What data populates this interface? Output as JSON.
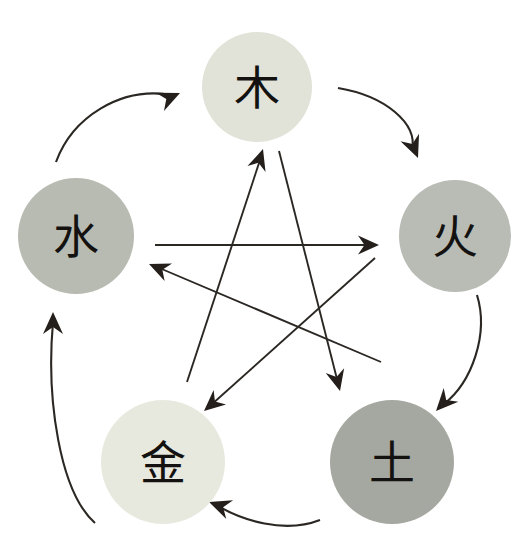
{
  "diagram": {
    "background_color": "#ffffff",
    "line_color": "#2b2723",
    "arrow_color": "#241f1b",
    "label_color": "#141210",
    "width": 523,
    "height": 557
  },
  "elements": [
    {
      "id": "wood",
      "label": "木",
      "position": "top",
      "cx": 257,
      "cy": 87,
      "r": 55,
      "fill": "#e1e3d9",
      "label_font_size": 46
    },
    {
      "id": "fire",
      "label": "火",
      "position": "right",
      "cx": 455,
      "cy": 236,
      "r": 56,
      "fill": "#b9bcb4",
      "label_font_size": 46
    },
    {
      "id": "earth",
      "label": "土",
      "position": "bottom-right",
      "cx": 392,
      "cy": 462,
      "r": 62,
      "fill": "#a5a8a0",
      "label_font_size": 48
    },
    {
      "id": "metal",
      "label": "金",
      "position": "bottom-left",
      "cx": 163,
      "cy": 462,
      "r": 62,
      "fill": "#e8e9de",
      "label_font_size": 48
    },
    {
      "id": "water",
      "label": "水",
      "position": "left",
      "cx": 76,
      "cy": 236,
      "r": 58,
      "fill": "#b8bbb2",
      "label_font_size": 46
    }
  ],
  "generating_cycle": {
    "name": "outer-arcs",
    "arcs": [
      {
        "id": "water-to-wood",
        "from": "water",
        "to": "wood",
        "path": "M 56 162 C 72 118 120 86 172 95",
        "tip": [
          180,
          93
        ],
        "angle": -24
      },
      {
        "id": "wood-to-fire",
        "from": "wood",
        "to": "fire",
        "path": "M 338 88 C 386 96 418 124 412 150",
        "tip": [
          418,
          158
        ],
        "angle": 68
      },
      {
        "id": "fire-to-earth",
        "from": "fire",
        "to": "earth",
        "path": "M 477 295 C 489 334 472 382 444 404",
        "tip": [
          436,
          411
        ],
        "angle": 133
      },
      {
        "id": "earth-to-metal",
        "from": "earth",
        "to": "metal",
        "path": "M 320 520 C 284 534 242 520 218 506",
        "tip": [
          209,
          502
        ],
        "angle": 200
      },
      {
        "id": "metal-to-water",
        "from": "metal",
        "to": "water",
        "path": "M 95 523 C 60 492 46 400 53 322",
        "tip": [
          53,
          312
        ],
        "angle": -90
      }
    ]
  },
  "overcoming_cycle": {
    "name": "inner-pentagram",
    "lines": [
      {
        "id": "water-to-fire",
        "from": "water",
        "to": "fire",
        "x1": 155,
        "y1": 245,
        "x2": 371,
        "y2": 245,
        "tip": [
          379,
          245
        ],
        "angle": 0
      },
      {
        "id": "fire-to-metal",
        "from": "fire",
        "to": "metal",
        "x1": 381,
        "y1": 362,
        "x2": 157,
        "y2": 267,
        "tip": [
          149,
          264
        ],
        "angle": 203
      },
      {
        "id": "metal-to-wood",
        "from": "metal",
        "to": "wood",
        "x1": 187,
        "y1": 382,
        "x2": 261,
        "y2": 157,
        "tip": [
          263,
          149
        ],
        "angle": -72
      },
      {
        "id": "wood-to-earth",
        "from": "wood",
        "to": "earth",
        "x1": 279,
        "y1": 151,
        "x2": 338,
        "y2": 383,
        "tip": [
          340,
          391
        ],
        "angle": 76
      },
      {
        "id": "earth-to-water",
        "from": "earth",
        "to": "water",
        "x1": 375,
        "y1": 258,
        "x2": 211,
        "y2": 405,
        "tip": [
          204,
          411
        ],
        "angle": 139
      }
    ]
  }
}
